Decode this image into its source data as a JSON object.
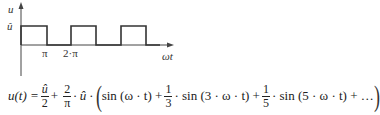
{
  "diagram": {
    "axes": {
      "y_label": "u",
      "x_label": "ωt",
      "y_tick_label": "û",
      "x_tick_labels": [
        "π",
        "2·π"
      ]
    },
    "waveform": {
      "type": "square",
      "high_level": "û",
      "low_level": "0",
      "pulses_visible": 3
    },
    "formula": {
      "lhs": "u(t) =",
      "term1_num": "û",
      "term1_den": "2",
      "plus1": "+",
      "term2_num": "2",
      "term2_den": "π",
      "term2_rest": "· û ·",
      "open_paren": "(",
      "sin1": "sin (ω · t) +",
      "frac3_num": "1",
      "frac3_den": "3",
      "sin3": "· sin (3 · ω · t) +",
      "frac5_num": "1",
      "frac5_den": "5",
      "sin5": "· sin (5 · ω · t) + …",
      "close_paren": ")"
    },
    "colors": {
      "line": "#333333",
      "background": "#ffffff"
    }
  }
}
